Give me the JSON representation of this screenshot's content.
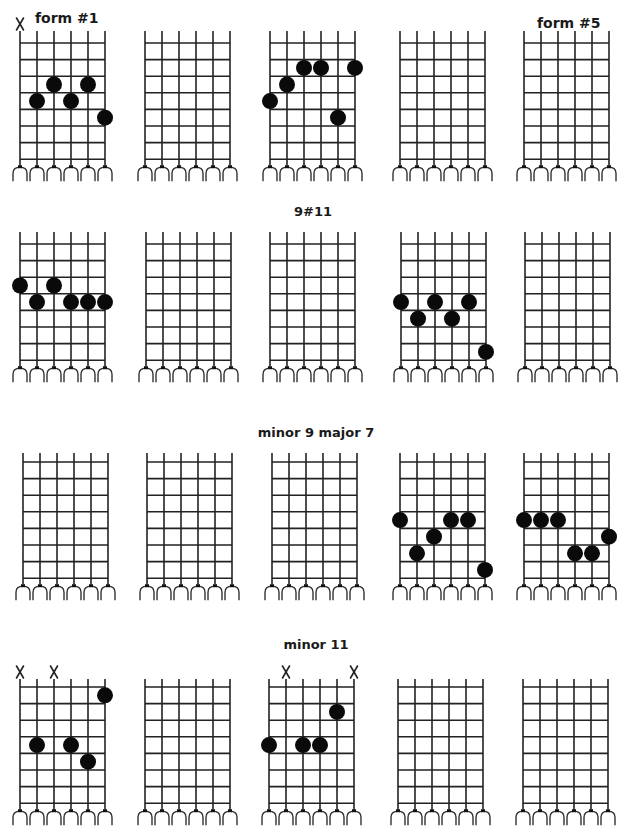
{
  "page": {
    "form_labels": [
      {
        "text": "form #1",
        "x": 35,
        "y": 10
      },
      {
        "text": "form #5",
        "x": 537,
        "y": 15
      }
    ]
  },
  "layout": {
    "fret_count": 8,
    "string_count": 6,
    "string_spacing": 17,
    "fret_spacing": 16.6
  },
  "rows": [
    {
      "title": "",
      "title_x": 313,
      "title_y": 0,
      "string_top": 31,
      "first_fret_y": 43,
      "arch_y": 165,
      "diagrams": [
        {
          "name": "form-1",
          "x": 20,
          "muted": [
            1
          ],
          "dots": [
            [
              2,
              4
            ],
            [
              3,
              3
            ],
            [
              4,
              4
            ],
            [
              5,
              3
            ],
            [
              6,
              5
            ]
          ]
        },
        {
          "name": "form-2",
          "x": 145,
          "muted": [],
          "dots": []
        },
        {
          "name": "form-3",
          "x": 270,
          "muted": [],
          "dots": [
            [
              1,
              4
            ],
            [
              2,
              3
            ],
            [
              3,
              2
            ],
            [
              4,
              2
            ],
            [
              5,
              5
            ],
            [
              6,
              2
            ]
          ]
        },
        {
          "name": "form-4",
          "x": 400,
          "muted": [],
          "dots": []
        },
        {
          "name": "form-5",
          "x": 524,
          "muted": [],
          "dots": []
        }
      ]
    },
    {
      "title": "9#11",
      "title_x": 313,
      "title_y": 204,
      "string_top": 232,
      "first_fret_y": 244,
      "arch_y": 366,
      "diagrams": [
        {
          "name": "form-1",
          "x": 20,
          "muted": [],
          "dots": [
            [
              1,
              3
            ],
            [
              2,
              4
            ],
            [
              3,
              3
            ],
            [
              4,
              4
            ],
            [
              5,
              4
            ],
            [
              6,
              4
            ]
          ]
        },
        {
          "name": "form-2",
          "x": 146,
          "muted": [],
          "dots": []
        },
        {
          "name": "form-3",
          "x": 270,
          "muted": [],
          "dots": []
        },
        {
          "name": "form-4",
          "x": 401,
          "muted": [],
          "dots": [
            [
              1,
              4
            ],
            [
              2,
              5
            ],
            [
              3,
              4
            ],
            [
              4,
              5
            ],
            [
              5,
              4
            ],
            [
              6,
              7
            ]
          ]
        },
        {
          "name": "form-5",
          "x": 525,
          "muted": [],
          "dots": []
        }
      ]
    },
    {
      "title": "minor 9 major 7",
      "title_x": 316,
      "title_y": 425,
      "string_top": 453,
      "first_fret_y": 462,
      "arch_y": 584,
      "diagrams": [
        {
          "name": "form-1",
          "x": 23,
          "muted": [],
          "dots": []
        },
        {
          "name": "form-2",
          "x": 147,
          "muted": [],
          "dots": []
        },
        {
          "name": "form-3",
          "x": 272,
          "muted": [],
          "dots": []
        },
        {
          "name": "form-4",
          "x": 400,
          "muted": [],
          "dots": [
            [
              1,
              4
            ],
            [
              2,
              6
            ],
            [
              3,
              5
            ],
            [
              4,
              4
            ],
            [
              5,
              4
            ],
            [
              6,
              7
            ]
          ]
        },
        {
          "name": "form-5",
          "x": 524,
          "muted": [],
          "dots": [
            [
              1,
              4
            ],
            [
              2,
              4
            ],
            [
              3,
              4
            ],
            [
              4,
              6
            ],
            [
              5,
              6
            ],
            [
              6,
              5
            ]
          ]
        }
      ]
    },
    {
      "title": "minor 11",
      "title_x": 316,
      "title_y": 637,
      "string_top": 679,
      "first_fret_y": 687,
      "arch_y": 809,
      "diagrams": [
        {
          "name": "form-1",
          "x": 20,
          "muted": [
            1,
            3
          ],
          "dots": [
            [
              2,
              4
            ],
            [
              4,
              4
            ],
            [
              5,
              5
            ],
            [
              6,
              1
            ]
          ]
        },
        {
          "name": "form-2",
          "x": 145,
          "muted": [],
          "dots": []
        },
        {
          "name": "form-3",
          "x": 269,
          "muted": [
            2,
            6
          ],
          "dots": [
            [
              1,
              4
            ],
            [
              3,
              4
            ],
            [
              4,
              4
            ],
            [
              5,
              2
            ]
          ]
        },
        {
          "name": "form-4",
          "x": 398,
          "muted": [],
          "dots": []
        },
        {
          "name": "form-5",
          "x": 523,
          "muted": [],
          "dots": []
        }
      ]
    }
  ],
  "icons": {
    "muted_string": "x-mark-icon",
    "finger_dot": "finger-dot-icon"
  }
}
